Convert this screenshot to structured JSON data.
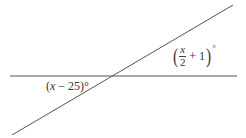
{
  "diagram": {
    "angle_left": {
      "prefix": "(",
      "var": "x",
      "op": " − ",
      "const": "25",
      "suffix": ")°"
    },
    "angle_right": {
      "num": "x",
      "den": "2",
      "op": "+ 1",
      "degree": "°"
    },
    "colors": {
      "line": "#555555",
      "text": "#333333"
    }
  }
}
